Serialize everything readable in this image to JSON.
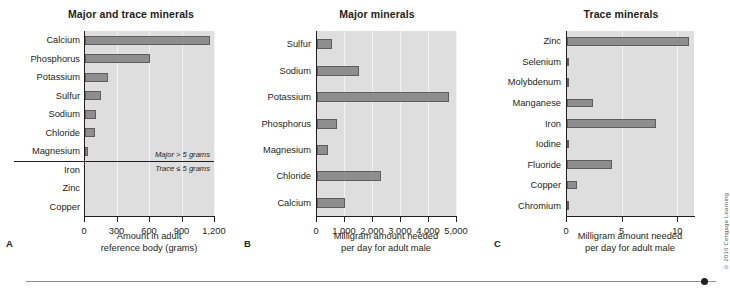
{
  "figure": {
    "credit": "© 2016 Cengage Learning",
    "footer_rule": "horizontal-rule-with-dot"
  },
  "chart_data": [
    {
      "id": "A",
      "panel_letter": "A",
      "type": "bar",
      "orientation": "horizontal",
      "title": "Major and trace minerals",
      "xlabel": "Amount in adult\nreference body (grams)",
      "xlabel_line1": "Amount in adult",
      "xlabel_line2": "reference body (grams)",
      "ylabel": "",
      "xlim": [
        0,
        1200
      ],
      "ticks": [
        0,
        300,
        600,
        900,
        1200
      ],
      "tick_labels": [
        "0",
        "300",
        "600",
        "900",
        "1,200"
      ],
      "grid": true,
      "categories": [
        "Calcium",
        "Phosphorus",
        "Potassium",
        "Sulfur",
        "Sodium",
        "Chloride",
        "Magnesium",
        "Iron",
        "Zinc",
        "Copper"
      ],
      "values": [
        1150,
        600,
        210,
        150,
        100,
        95,
        30,
        0,
        0,
        0
      ],
      "annotations": [
        {
          "text": "Major > 5 grams",
          "position": "above-divider"
        },
        {
          "text": "Trace ≤ 5 grams",
          "position": "below-divider"
        }
      ],
      "divider_after_category": "Magnesium"
    },
    {
      "id": "B",
      "panel_letter": "B",
      "type": "bar",
      "orientation": "horizontal",
      "title": "Major minerals",
      "xlabel_line1": "Milligram amount needed",
      "xlabel_line2": "per day for adult male",
      "ylabel": "",
      "xlim": [
        0,
        5000
      ],
      "ticks": [
        0,
        1000,
        2000,
        3000,
        4000,
        5000
      ],
      "tick_labels": [
        "0",
        "1,000",
        "2,000",
        "3,000",
        "4,000",
        "5,000"
      ],
      "grid": true,
      "categories": [
        "Sulfur",
        "Sodium",
        "Potassium",
        "Phosphorus",
        "Magnesium",
        "Chloride",
        "Calcium"
      ],
      "values": [
        550,
        1500,
        4700,
        700,
        400,
        2300,
        1000
      ]
    },
    {
      "id": "C",
      "panel_letter": "C",
      "type": "bar",
      "orientation": "horizontal",
      "title": "Trace minerals",
      "xlabel_line1": "Milligram amount needed",
      "xlabel_line2": "per day for adult male",
      "ylabel": "",
      "xlim": [
        0,
        11.5
      ],
      "ticks": [
        0,
        5,
        10
      ],
      "tick_labels": [
        "0",
        "5",
        "10"
      ],
      "grid": true,
      "categories": [
        "Zinc",
        "Selenium",
        "Molybdenum",
        "Manganese",
        "Iron",
        "Iodine",
        "Fluoride",
        "Copper",
        "Chromium"
      ],
      "values": [
        11,
        0.055,
        0.045,
        2.3,
        8,
        0.15,
        4,
        0.9,
        0.035
      ]
    }
  ]
}
